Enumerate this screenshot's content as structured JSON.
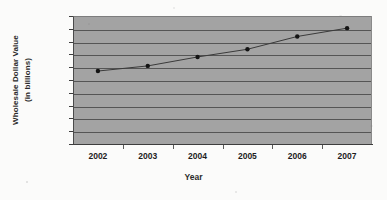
{
  "chart_data": {
    "type": "line",
    "title": "",
    "xlabel": "Year",
    "ylabel_lines": [
      "Wholesale Dollar Value",
      "(in billions)"
    ],
    "ylabel": "Wholesale Dollar Value (in billions)",
    "categories": [
      "2002",
      "2003",
      "2004",
      "2005",
      "2006",
      "2007"
    ],
    "values": [
      57,
      61,
      68,
      74,
      84,
      90.5
    ],
    "series": [
      {
        "name": "Wholesale Dollar Value",
        "values": [
          57,
          61,
          68,
          74,
          84,
          90.5
        ]
      }
    ],
    "ylim": [
      0,
      100
    ],
    "ytick_step": 10,
    "yticks": [
      "0",
      "10",
      "20",
      "30",
      "40",
      "50",
      "60",
      "70",
      "80",
      "90",
      "100"
    ],
    "grid": true,
    "grid_axis": "y",
    "legend": false,
    "legend_position": "none",
    "marker": "filled-circle",
    "colors": {
      "plot_background": "#a3a3a3",
      "gridline": "#555555",
      "axis": "#3d3d3d",
      "line": "#3a3a3a",
      "marker": "#141414",
      "text": "#1d1d1d",
      "page_background": "#fbfbfa"
    }
  }
}
